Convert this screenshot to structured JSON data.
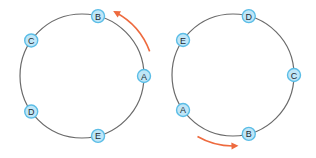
{
  "diagram": {
    "type": "consistent-hash-ring-rotation",
    "colors": {
      "ring": "#6a6a6a",
      "node_fill": "#bfe6f7",
      "node_stroke": "#5bbde6",
      "node_text": "#1d2a33",
      "arrow": "#ee6a3e"
    },
    "rings": [
      {
        "id": "left",
        "nodes": [
          {
            "label": "B",
            "angle_deg": 75
          },
          {
            "label": "C",
            "angle_deg": 145
          },
          {
            "label": "A",
            "angle_deg": 0
          },
          {
            "label": "D",
            "angle_deg": 215
          },
          {
            "label": "E",
            "angle_deg": 285
          }
        ],
        "arrow": {
          "direction": "counterclockwise",
          "from_deg": 20,
          "to_deg": 62
        }
      },
      {
        "id": "right",
        "nodes": [
          {
            "label": "D",
            "angle_deg": 75
          },
          {
            "label": "E",
            "angle_deg": 145
          },
          {
            "label": "C",
            "angle_deg": 0
          },
          {
            "label": "A",
            "angle_deg": 215
          },
          {
            "label": "B",
            "angle_deg": 285
          }
        ],
        "arrow": {
          "direction": "counterclockwise-bottom",
          "from_deg": 240,
          "to_deg": 272
        }
      }
    ]
  }
}
